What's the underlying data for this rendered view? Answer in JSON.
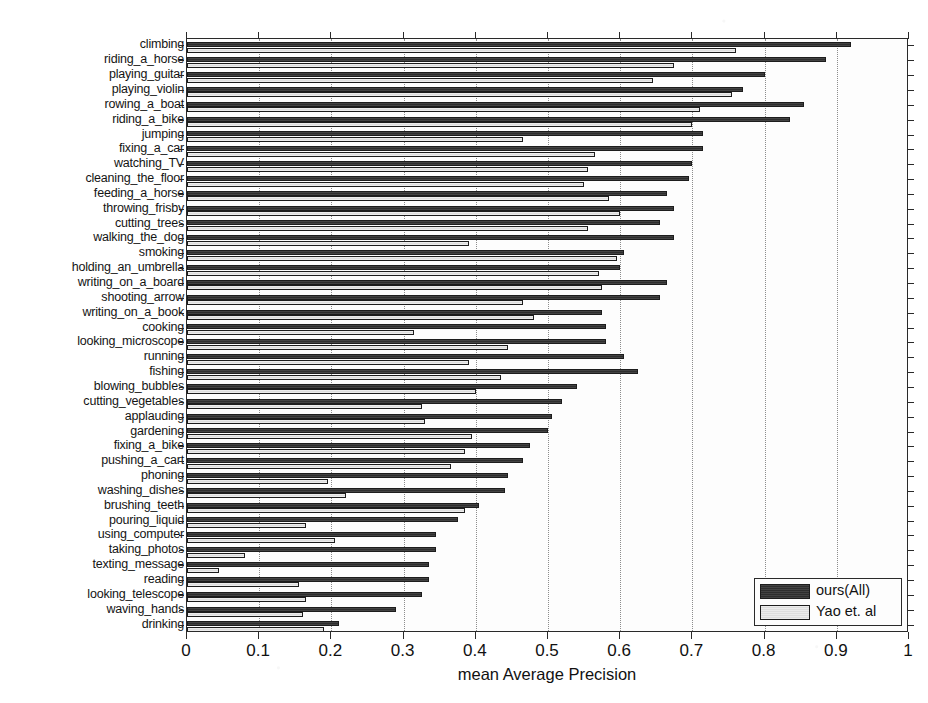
{
  "chart_data": {
    "type": "bar",
    "orientation": "horizontal",
    "title": "",
    "xlabel": "mean Average Precision",
    "ylabel": "",
    "xlim": [
      0,
      1
    ],
    "xticks": [
      "0",
      "0.1",
      "0.2",
      "0.3",
      "0.4",
      "0.5",
      "0.6",
      "0.7",
      "0.8",
      "0.9",
      "1"
    ],
    "xtick_values": [
      0,
      0.1,
      0.2,
      0.3,
      0.4,
      0.5,
      0.6,
      0.7,
      0.8,
      0.9,
      1
    ],
    "grid": "dotted-vertical",
    "legend_position": "bottom-right",
    "categories": [
      "climbing",
      "riding_a_horse",
      "playing_guitar",
      "playing_violin",
      "rowing_a_boat",
      "riding_a_bike",
      "jumping",
      "fixing_a_car",
      "watching_TV",
      "cleaning_the_floor",
      "feeding_a_horse",
      "throwing_frisby",
      "cutting_trees",
      "walking_the_dog",
      "smoking",
      "holding_an_umbrella",
      "writing_on_a_board",
      "shooting_arrow",
      "writing_on_a_book",
      "cooking",
      "looking_microscope",
      "running",
      "fishing",
      "blowing_bubbles",
      "cutting_vegetables",
      "applauding",
      "gardening",
      "fixing_a_bike",
      "pushing_a_cart",
      "phoning",
      "washing_dishes",
      "brushing_teeth",
      "pouring_liquid",
      "using_computer",
      "taking_photos",
      "texting_message",
      "reading",
      "looking_telescope",
      "waving_hands",
      "drinking"
    ],
    "series": [
      {
        "name": "ours(All)",
        "color": "#3a3a3a",
        "values": [
          0.92,
          0.885,
          0.8,
          0.77,
          0.855,
          0.835,
          0.715,
          0.715,
          0.7,
          0.695,
          0.665,
          0.675,
          0.655,
          0.675,
          0.605,
          0.6,
          0.665,
          0.655,
          0.575,
          0.58,
          0.58,
          0.605,
          0.625,
          0.54,
          0.52,
          0.505,
          0.5,
          0.475,
          0.465,
          0.445,
          0.44,
          0.405,
          0.375,
          0.345,
          0.345,
          0.335,
          0.335,
          0.325,
          0.29,
          0.21
        ]
      },
      {
        "name": "Yao et. al",
        "color": "#e6e6e6",
        "values": [
          0.76,
          0.675,
          0.645,
          0.755,
          0.71,
          0.7,
          0.465,
          0.565,
          0.555,
          0.55,
          0.585,
          0.6,
          0.555,
          0.39,
          0.595,
          0.57,
          0.575,
          0.465,
          0.48,
          0.315,
          0.445,
          0.39,
          0.435,
          0.4,
          0.325,
          0.33,
          0.395,
          0.385,
          0.365,
          0.195,
          0.22,
          0.385,
          0.165,
          0.205,
          0.08,
          0.045,
          0.155,
          0.165,
          0.16,
          0.19
        ]
      }
    ]
  },
  "axis": {
    "x_title": "mean Average Precision"
  },
  "legend": {
    "entries": [
      {
        "label": "ours(All)"
      },
      {
        "label": "Yao et. al"
      }
    ]
  }
}
